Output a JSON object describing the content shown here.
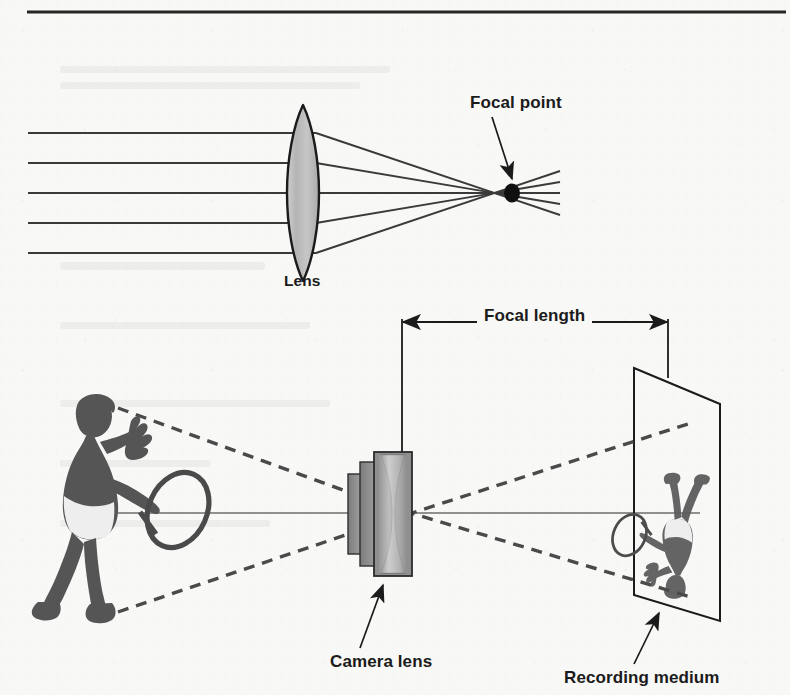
{
  "figure": {
    "kind": "optics-diagram",
    "background_color": "#f8f8f6",
    "ink_color": "#1b1b1b",
    "glass_fill_color": "#b9b9b9",
    "barrel_fill_color": "#8e8e8e"
  },
  "header": {
    "rule": {
      "name": "top-rule",
      "x1": 27,
      "x2": 786,
      "y": 12,
      "thickness": 3
    }
  },
  "top_panel": {
    "title_absent": true,
    "labels": {
      "focal_point": "Focal point",
      "lens": "Lens"
    },
    "focal_point_label_pos": {
      "x": 470,
      "y": 100
    },
    "lens_label_pos": {
      "x": 283,
      "y": 277
    },
    "lens": {
      "cx": 303,
      "cy": 193,
      "half_width": 16,
      "half_height": 88
    },
    "focal_point": {
      "x": 512,
      "y": 193,
      "rx": 8,
      "ry": 9
    },
    "incoming_ray_ys": [
      133,
      163,
      193,
      223,
      253
    ],
    "ray_start_x": 28,
    "ray_exit_x": 316,
    "ray_overshoot_x": 560
  },
  "bottom_panel": {
    "labels": {
      "focal_length": "Focal length",
      "camera_lens": "Camera lens",
      "recording_medium": "Recording medium"
    },
    "focal_length_label_pos": {
      "x": 477,
      "y": 308
    },
    "camera_lens_label_pos": {
      "x": 330,
      "y": 661
    },
    "recording_medium_label_pos": {
      "x": 564,
      "y": 678
    },
    "dimension_line": {
      "y": 322,
      "x1": 402,
      "x2": 668
    },
    "dimension_tick_left": {
      "x": 402,
      "y1": 322,
      "y2": 468
    },
    "dimension_tick_right": {
      "x": 668,
      "y1": 322,
      "y2": 378
    },
    "optical_axis": {
      "y": 513,
      "x1": 118,
      "x2": 700
    },
    "camera": {
      "center_x": 388,
      "glass": {
        "x": 374,
        "y": 452,
        "w": 36,
        "h": 124
      },
      "barrel_mid": {
        "x": 360,
        "y": 462,
        "w": 18,
        "h": 104
      },
      "barrel_rear": {
        "x": 348,
        "y": 474,
        "w": 14,
        "h": 80
      }
    },
    "screen": {
      "name": "recording-medium-plane",
      "points": "634,368 720,404 720,621 634,595"
    },
    "subject": {
      "name": "tennis-player",
      "x": 28,
      "y": 392,
      "w": 140,
      "h": 228
    },
    "image": {
      "name": "inverted-tennis-player",
      "x": 645,
      "y": 408,
      "w": 80,
      "h": 185
    },
    "ray_pairs": [
      {
        "from": "subject-top",
        "x1": 118,
        "y1": 408,
        "x2": 384,
        "y2": 505,
        "x3": 694,
        "y3": 598
      },
      {
        "from": "subject-bottom",
        "x1": 118,
        "y1": 612,
        "x2": 384,
        "y2": 522,
        "x3": 694,
        "y3": 422
      }
    ],
    "callouts": [
      {
        "name": "camera-lens-callout",
        "x1": 383,
        "y1": 584,
        "x2": 363,
        "y2": 646
      },
      {
        "name": "recording-medium-callout",
        "x1": 660,
        "y1": 612,
        "x2": 636,
        "y2": 663
      },
      {
        "name": "focal-point-callout",
        "x1": 492,
        "y1": 118,
        "x2": 513,
        "y2": 180
      }
    ]
  }
}
